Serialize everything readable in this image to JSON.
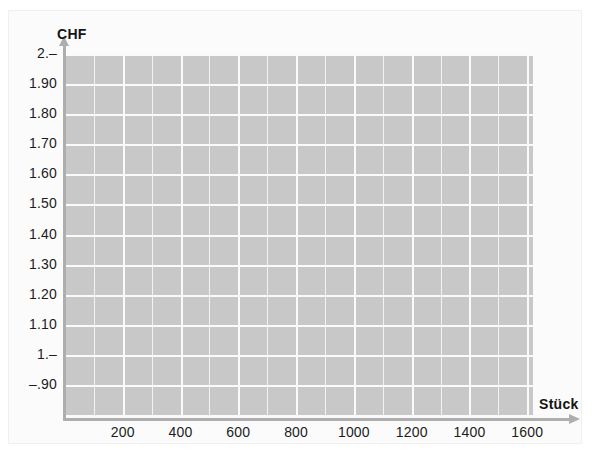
{
  "chart_data": {
    "type": "line",
    "title": "",
    "xlabel": "Stück",
    "ylabel": "CHF",
    "xlim": [
      0,
      1620
    ],
    "ylim": [
      0.8,
      2.0
    ],
    "grid": true,
    "legend": null,
    "series": [],
    "x_ticks": [
      {
        "value": 200,
        "label": "200"
      },
      {
        "value": 400,
        "label": "400"
      },
      {
        "value": 600,
        "label": "600"
      },
      {
        "value": 800,
        "label": "800"
      },
      {
        "value": 1000,
        "label": "1000"
      },
      {
        "value": 1200,
        "label": "1200"
      },
      {
        "value": 1400,
        "label": "1400"
      },
      {
        "value": 1600,
        "label": "1600"
      }
    ],
    "y_ticks": [
      {
        "value": 2.0,
        "label": "2.–"
      },
      {
        "value": 1.9,
        "label": "1.90"
      },
      {
        "value": 1.8,
        "label": "1.80"
      },
      {
        "value": 1.7,
        "label": "1.70"
      },
      {
        "value": 1.6,
        "label": "1.60"
      },
      {
        "value": 1.5,
        "label": "1.50"
      },
      {
        "value": 1.4,
        "label": "1.40"
      },
      {
        "value": 1.3,
        "label": "1.30"
      },
      {
        "value": 1.2,
        "label": "1.20"
      },
      {
        "value": 1.1,
        "label": "1.10"
      },
      {
        "value": 1.0,
        "label": "1.–"
      },
      {
        "value": 0.9,
        "label": "–.90"
      }
    ],
    "colors": {
      "plot_background": "#c8c8c8",
      "gridline": "#f2f2f2",
      "gridline_major": "#fafafa",
      "axis": "#aeaeae",
      "text": "#1c1c1c",
      "paper": "#fbfbfb"
    }
  }
}
